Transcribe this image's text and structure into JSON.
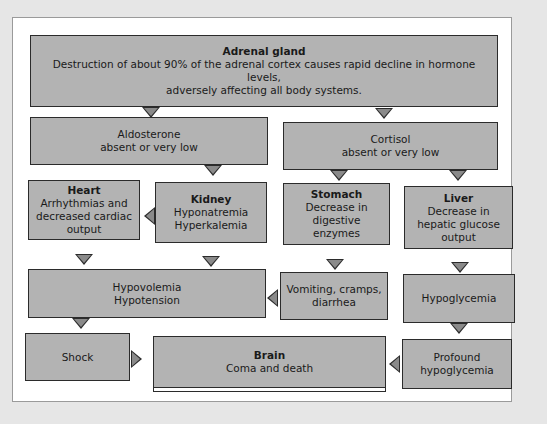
{
  "diagram": {
    "nodes": {
      "adrenal": {
        "title": "Adrenal gland",
        "line1": "Destruction of about 90% of the adrenal cortex causes rapid decline in hormone levels,",
        "line2": "adversely affecting all body systems."
      },
      "aldosterone": {
        "line1": "Aldosterone",
        "line2": "absent or very low"
      },
      "cortisol": {
        "line1": "Cortisol",
        "line2": "absent or very low"
      },
      "heart": {
        "title": "Heart",
        "line1": "Arrhythmias and",
        "line2": "decreased cardiac",
        "line3": "output"
      },
      "kidney": {
        "title": "Kidney",
        "line1": "Hyponatremia",
        "line2": "Hyperkalemia"
      },
      "stomach": {
        "title": "Stomach",
        "line1": "Decrease in",
        "line2": "digestive enzymes"
      },
      "liver": {
        "title": "Liver",
        "line1": "Decrease in",
        "line2": "hepatic glucose",
        "line3": "output"
      },
      "hypovolemia": {
        "line1": "Hypovolemia",
        "line2": "Hypotension"
      },
      "vomiting": {
        "line1": "Vomiting, cramps,",
        "line2": "diarrhea"
      },
      "hypoglycemia": {
        "line1": "Hypoglycemia"
      },
      "shock": {
        "line1": "Shock"
      },
      "brain": {
        "title": "Brain",
        "line1": "Coma and death"
      },
      "profound": {
        "line1": "Profound",
        "line2": "hypoglycemia"
      }
    },
    "edges": [
      [
        "adrenal",
        "aldosterone"
      ],
      [
        "adrenal",
        "cortisol"
      ],
      [
        "aldosterone",
        "kidney"
      ],
      [
        "kidney",
        "heart"
      ],
      [
        "cortisol",
        "stomach"
      ],
      [
        "cortisol",
        "liver"
      ],
      [
        "heart",
        "hypovolemia"
      ],
      [
        "kidney",
        "hypovolemia"
      ],
      [
        "stomach",
        "vomiting"
      ],
      [
        "vomiting",
        "hypovolemia"
      ],
      [
        "liver",
        "hypoglycemia"
      ],
      [
        "hypoglycemia",
        "profound"
      ],
      [
        "hypovolemia",
        "shock"
      ],
      [
        "shock",
        "brain"
      ],
      [
        "profound",
        "brain"
      ]
    ],
    "colors": {
      "box_fill": "#b3b3b3",
      "border": "#2b2b2b",
      "arrow_fill": "#8a8a8a",
      "panel": "#ffffff",
      "background": "#e6e6e6"
    }
  }
}
